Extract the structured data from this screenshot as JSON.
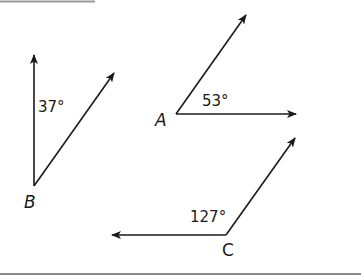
{
  "figure": {
    "colors": {
      "stroke": "#1a1a1a",
      "rule": "#8a8a8a",
      "background": "#ffffff"
    },
    "angles": [
      {
        "vertex": "B",
        "measure": "37°",
        "degrees": 37,
        "orientation": "vertical ray up, second ray up-right"
      },
      {
        "vertex": "A",
        "measure": "53°",
        "degrees": 53,
        "orientation": "horizontal ray right, second ray up-right"
      },
      {
        "vertex": "C",
        "measure": "127°",
        "degrees": 127,
        "orientation": "horizontal ray left, second ray up-right"
      }
    ]
  }
}
